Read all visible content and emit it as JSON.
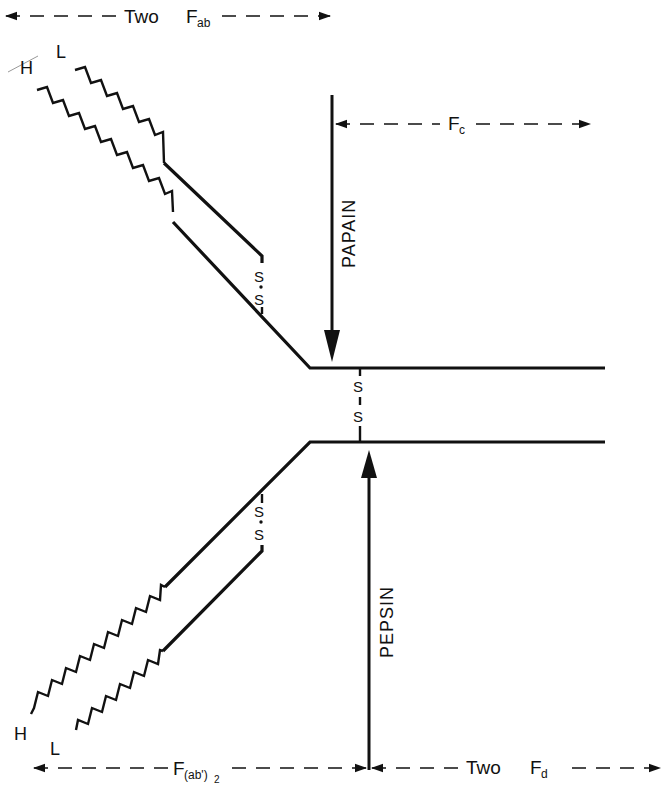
{
  "diagram": {
    "colors": {
      "ink": "#111111",
      "background": "#ffffff"
    },
    "labels": {
      "top_span": {
        "prefix": "Two",
        "main": "F",
        "sub": "ab"
      },
      "fc_span": {
        "main": "F",
        "sub": "c"
      },
      "bottom_left_span": {
        "main": "F",
        "sub": "(ab')",
        "sub2": "2"
      },
      "bottom_right_span": {
        "prefix": "Two",
        "main": "F",
        "sub": "d"
      },
      "upper_heavy": "H",
      "upper_light": "L",
      "lower_heavy": "H",
      "lower_light": "L",
      "papain": "PAPAIN",
      "pepsin": "PEPSIN",
      "disulfide_s": "S"
    },
    "enzymes": [
      {
        "name": "PAPAIN",
        "direction": "down",
        "cleaves": "above hinge disulfide"
      },
      {
        "name": "PEPSIN",
        "direction": "up",
        "cleaves": "below hinge disulfide"
      }
    ],
    "fragments": [
      {
        "name": "Two Fab",
        "span": "top-left"
      },
      {
        "name": "Fc",
        "span": "top-right"
      },
      {
        "name": "F(ab')2",
        "span": "bottom-left"
      },
      {
        "name": "Two Fd",
        "span": "bottom-right"
      }
    ],
    "disulfide_bonds": [
      {
        "between": "upper H and L chains"
      },
      {
        "between": "heavy chains at hinge"
      },
      {
        "between": "lower H and L chains"
      }
    ]
  }
}
